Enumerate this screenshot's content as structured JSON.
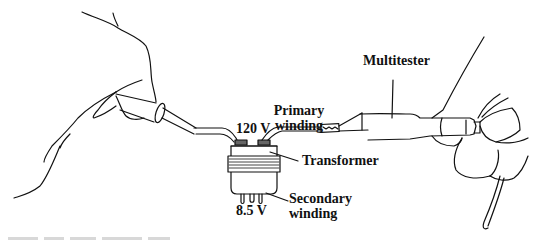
{
  "figure": {
    "labels": {
      "multitester": "Multitester",
      "primary_winding_line1": "Primary",
      "primary_winding_line2": "winding",
      "primary_voltage": "120 V",
      "transformer": "Transformer",
      "secondary_voltage": "8.5 V",
      "secondary_winding_line1": "Secondary",
      "secondary_winding_line2": "winding"
    },
    "colors": {
      "line": "#111111",
      "background": "#ffffff",
      "winding_band": "#555555"
    }
  }
}
